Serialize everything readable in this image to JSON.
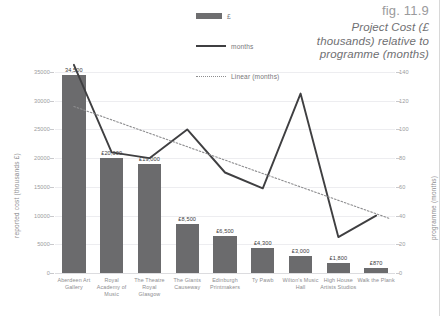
{
  "figure": {
    "number": "fig. 11.9",
    "title": "Project Cost (£ thousands) relative to programme (months)"
  },
  "legend": {
    "position": "top-center",
    "items": [
      {
        "label": "£",
        "marker": "bar-swatch",
        "color": "#6e6e70"
      },
      {
        "label": "months",
        "marker": "solid-line",
        "color": "#3f3f41"
      },
      {
        "label": "Linear (months)",
        "marker": "dotted-line",
        "color": "#8d8d8f"
      }
    ]
  },
  "chart_data": {
    "type": "bar",
    "title": "Project Cost (£ thousands) relative to programme (months)",
    "xlabel": "",
    "ylabel": "reported cost (thousands £)",
    "y2label": "programme (months)",
    "categories": [
      "Aberdeen Art Gallery",
      "Royal Academy of Music",
      "The Theatre Royal Glasgow",
      "The Giants Causeway",
      "Edinburgh Printmakers",
      "Ty Pawb",
      "Wilton's Music Hall",
      "High House Artists Studios",
      "Walk the Plank"
    ],
    "series": [
      {
        "name": "£",
        "type": "bar",
        "axis": "left",
        "values": [
          34500,
          20000,
          19000,
          8500,
          6500,
          4300,
          3000,
          1800,
          870
        ],
        "data_labels": [
          "34,500",
          "£20,000",
          "£19,000",
          "£8,500",
          "£6,500",
          "£4,300",
          "£3,000",
          "£1,800",
          "£870"
        ]
      },
      {
        "name": "months",
        "type": "line",
        "axis": "right",
        "values": [
          145,
          84,
          80,
          100,
          70,
          59,
          125,
          25,
          40
        ]
      },
      {
        "name": "Linear (months)",
        "type": "trendline",
        "axis": "right",
        "values": [
          116,
          106,
          96,
          86,
          76,
          66,
          56,
          46,
          38
        ]
      }
    ],
    "ylim": [
      0,
      35000
    ],
    "yticks": [
      "0",
      "5000",
      "10000",
      "15000",
      "20000",
      "25000",
      "30000",
      "35000"
    ],
    "y2lim": [
      0,
      140
    ],
    "y2ticks": [
      "0",
      "20",
      "40",
      "60",
      "80",
      "100",
      "120",
      "140"
    ],
    "grid": true
  },
  "colors": {
    "bar": "#6b6b6d",
    "line": "#3f3f41",
    "trendline": "#8d8d8f",
    "grid": "#ededf0",
    "text": "#8d8d90"
  }
}
